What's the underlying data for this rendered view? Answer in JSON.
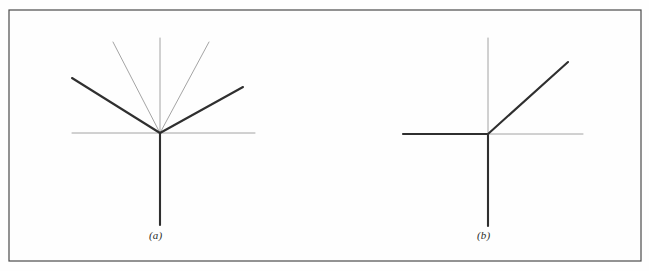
{
  "figure": {
    "background_color": "#fefefe",
    "frame": {
      "x": 9,
      "y": 10,
      "width": 632,
      "height": 251,
      "stroke_color": "#4a4a4a",
      "stroke_width": 1.2
    },
    "colors": {
      "thin_stroke": "#9a9a9a",
      "thick_stroke": "#2f2f2f",
      "caption_text": "#2b2b2b"
    },
    "stroke_widths": {
      "thin": 0.9,
      "thick": 2.1
    },
    "panels": [
      {
        "id": "a",
        "caption": "(a)",
        "origin": {
          "x": 160,
          "y": 133
        },
        "axes": [
          {
            "name": "vertical-axis-up",
            "weight": "thin",
            "x1": 160,
            "y1": 38,
            "x2": 160,
            "y2": 133
          },
          {
            "name": "vertical-axis-down",
            "weight": "thick",
            "x1": 160,
            "y1": 133,
            "x2": 160,
            "y2": 225
          },
          {
            "name": "horizontal-axis-left",
            "weight": "thin",
            "x1": 72,
            "y1": 133,
            "x2": 160,
            "y2": 133
          },
          {
            "name": "horizontal-axis-right",
            "weight": "thin",
            "x1": 160,
            "y1": 133,
            "x2": 255,
            "y2": 133
          }
        ],
        "rays": [
          {
            "name": "thin-ray-upper-left",
            "weight": "thin",
            "x1": 160,
            "y1": 133,
            "x2": 113,
            "y2": 42,
            "angle_deg": 117
          },
          {
            "name": "thin-ray-upper-right",
            "weight": "thin",
            "x1": 160,
            "y1": 133,
            "x2": 209,
            "y2": 42,
            "angle_deg": 62
          },
          {
            "name": "thick-ray-upper-left",
            "weight": "thick",
            "x1": 160,
            "y1": 133,
            "x2": 72,
            "y2": 78,
            "angle_deg": 148
          },
          {
            "name": "thick-ray-upper-right",
            "weight": "thick",
            "x1": 160,
            "y1": 133,
            "x2": 243,
            "y2": 87,
            "angle_deg": 29
          }
        ]
      },
      {
        "id": "b",
        "caption": "(b)",
        "origin": {
          "x": 488,
          "y": 134
        },
        "axes": [
          {
            "name": "vertical-axis-up",
            "weight": "thin",
            "x1": 488,
            "y1": 38,
            "x2": 488,
            "y2": 134
          },
          {
            "name": "vertical-axis-down",
            "weight": "thick",
            "x1": 488,
            "y1": 134,
            "x2": 488,
            "y2": 226
          },
          {
            "name": "horizontal-axis-left",
            "weight": "thick",
            "x1": 403,
            "y1": 134,
            "x2": 488,
            "y2": 134
          },
          {
            "name": "horizontal-axis-right",
            "weight": "thin",
            "x1": 488,
            "y1": 134,
            "x2": 583,
            "y2": 134
          }
        ],
        "rays": [
          {
            "name": "thick-ray-upper-right",
            "weight": "thick",
            "x1": 488,
            "y1": 134,
            "x2": 568,
            "y2": 62,
            "angle_deg": 42
          }
        ]
      }
    ]
  }
}
